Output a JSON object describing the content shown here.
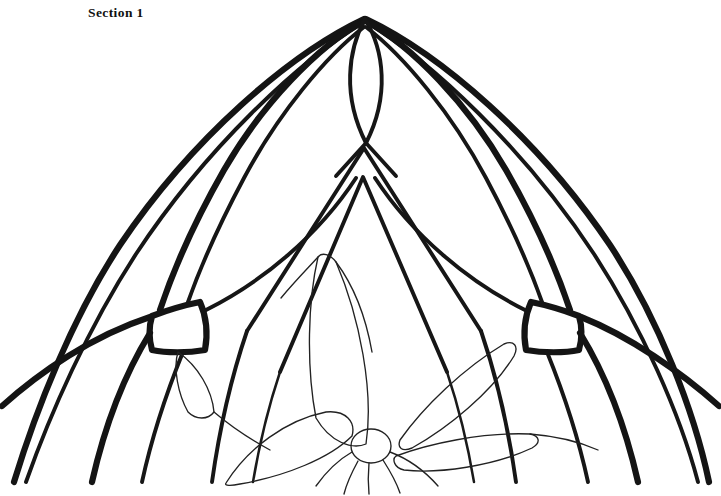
{
  "page": {
    "title": "Section 1",
    "background_color": "#ffffff",
    "ink_color": "#141414",
    "width": 721,
    "height": 496,
    "artwork_type": "stained-glass-pattern-line-drawing"
  },
  "header": {
    "label": "Section 1"
  },
  "line_weights": {
    "heavy": 6.2,
    "medium": 3.9,
    "light": 2.5,
    "thin": 1.35
  },
  "geometry": {
    "apex": {
      "x": 365,
      "y": 18
    },
    "inner_arch_apex": {
      "x": 363,
      "y": 177
    },
    "vesica": {
      "top": {
        "x": 365,
        "y": 18
      },
      "bottom": {
        "x": 366,
        "y": 143
      },
      "left": {
        "x": 343,
        "y": 80
      },
      "right": {
        "x": 389,
        "y": 80
      }
    },
    "keystone_left": {
      "x": 150,
      "y": 303,
      "width": 56,
      "height": 48
    },
    "keystone_right": {
      "x": 525,
      "y": 303,
      "width": 56,
      "height": 48
    },
    "flower_center": {
      "x": 371,
      "y": 446,
      "rx": 20,
      "ry": 17
    },
    "outer_arch_left_foot": {
      "x": 12,
      "y": 482
    },
    "outer_arch_right_foot": {
      "x": 710,
      "y": 482
    }
  },
  "elements": {
    "outer_arch_outermost": "outer-arch-outermost",
    "outer_arch_inner": "outer-arch-inner",
    "main_arch_heavy": "main-arch-heavy",
    "secondary_arch": "secondary-arch",
    "inner_pointed_arch_outer": "inner-pointed-arch-outer",
    "inner_pointed_arch_inner": "inner-pointed-arch-inner",
    "vesica_apex": "vesica-apex-ornament",
    "keystone_left": "keystone-block-left",
    "keystone_right": "keystone-block-right",
    "flower_center": "flower-center",
    "petal_top_center": "petal-top-center",
    "petal_left_large": "petal-left-large",
    "petal_right_upper": "petal-right-upper",
    "petal_right_lower": "petal-right-lower",
    "leaf_left_small": "leaf-left-small",
    "stamens": "flower-stamens"
  }
}
